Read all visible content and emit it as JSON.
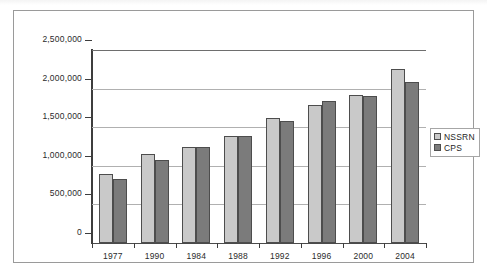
{
  "chart_data": {
    "type": "bar",
    "title": "",
    "subtitle": "",
    "xlabel": "",
    "ylabel": "",
    "categories": [
      "1977",
      "1990",
      "1984",
      "1988",
      "1992",
      "1996",
      "2000",
      "2004"
    ],
    "series": [
      {
        "name": "NSSRN",
        "color": "#c9c9c9",
        "values": [
          890000,
          1150000,
          1240000,
          1390000,
          1620000,
          1790000,
          1920000,
          2250000
        ]
      },
      {
        "name": "CPS",
        "color": "#7b7b7b",
        "values": [
          830000,
          1070000,
          1250000,
          1380000,
          1580000,
          1840000,
          1900000,
          2080000
        ]
      }
    ],
    "ylim": [
      0,
      2500000
    ],
    "ytick_values": [
      0,
      500000,
      1000000,
      1500000,
      2000000,
      2500000
    ],
    "ytick_labels": [
      "0",
      "500,000",
      "1,000,000",
      "1,500,000",
      "2,000,000",
      "2,500,000"
    ],
    "grid": true,
    "legend_position": "right"
  },
  "legend": {
    "items": [
      {
        "label": "NSSRN",
        "color": "#c9c9c9"
      },
      {
        "label": "CPS",
        "color": "#7b7b7b"
      }
    ]
  },
  "colors": {
    "series_a": "#c9c9c9",
    "series_b": "#7b7b7b",
    "frame": "#9a9a9a",
    "gridline": "#b0b0b0",
    "axis": "#3d3d3d",
    "text": "#2b2b2b",
    "background": "#ffffff"
  }
}
